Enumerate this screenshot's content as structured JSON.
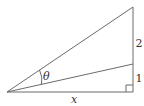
{
  "diagram": {
    "type": "right-triangle-with-inner-segment",
    "colors": {
      "stroke": "#6b6b6b",
      "text": "#333333",
      "background": "#ffffff"
    },
    "points": {
      "apex": [
        7,
        92
      ],
      "right_angle": [
        133,
        92
      ],
      "top": [
        133,
        7
      ],
      "middle": [
        133,
        64
      ]
    },
    "labels": {
      "angle": "θ",
      "base": "x",
      "upper_segment": "2",
      "lower_segment": "1"
    }
  }
}
